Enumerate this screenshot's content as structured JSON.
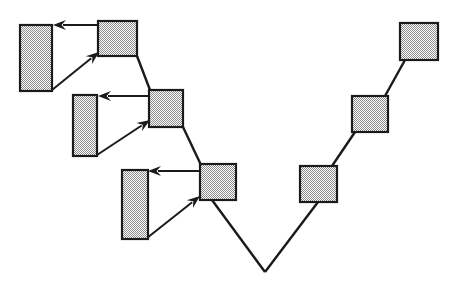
{
  "canvas": {
    "width": 462,
    "height": 296,
    "background": "#ffffff",
    "line_color": "#1a1a1a",
    "node_fill": "#a8a8a8",
    "node_stroke": "#1a1a1a"
  },
  "diagram": {
    "title": "",
    "type": "tree-diagram",
    "nodes": [
      {
        "id": "sq1",
        "label": "",
        "x": 98,
        "y": 21,
        "w": 39,
        "h": 35,
        "shape": "square"
      },
      {
        "id": "sq2",
        "label": "",
        "x": 149,
        "y": 90,
        "w": 34,
        "h": 37,
        "shape": "square"
      },
      {
        "id": "sq3",
        "label": "",
        "x": 200,
        "y": 164,
        "w": 36,
        "h": 36,
        "shape": "square"
      },
      {
        "id": "sq4",
        "label": "",
        "x": 300,
        "y": 166,
        "w": 37,
        "h": 36,
        "shape": "square"
      },
      {
        "id": "sq5",
        "label": "",
        "x": 352,
        "y": 96,
        "w": 36,
        "h": 36,
        "shape": "square"
      },
      {
        "id": "sq6",
        "label": "",
        "x": 400,
        "y": 23,
        "w": 38,
        "h": 37,
        "shape": "square"
      }
    ],
    "tall_rects": [
      {
        "id": "rect1",
        "label": "",
        "x": 20,
        "y": 25,
        "w": 32,
        "h": 66,
        "shape": "rectangle"
      },
      {
        "id": "rect2",
        "label": "",
        "x": 73,
        "y": 95,
        "w": 24,
        "h": 61,
        "shape": "rectangle"
      },
      {
        "id": "rect3",
        "label": "",
        "x": 122,
        "y": 170,
        "w": 26,
        "h": 69,
        "shape": "rectangle"
      }
    ],
    "edges": [
      {
        "id": "e1",
        "from": "sq1",
        "to": "sq2",
        "x1": 137,
        "y1": 56,
        "x2": 150,
        "y2": 90
      },
      {
        "id": "e2",
        "from": "sq2",
        "to": "sq3",
        "x1": 183,
        "y1": 127,
        "x2": 201,
        "y2": 165
      },
      {
        "id": "e3",
        "from": "sq3",
        "to": "apex",
        "x1": 212,
        "y1": 200,
        "x2": 265,
        "y2": 272
      },
      {
        "id": "e4",
        "from": "apex",
        "to": "sq4",
        "x1": 265,
        "y1": 272,
        "x2": 318,
        "y2": 202
      },
      {
        "id": "e5",
        "from": "sq4",
        "to": "sq5",
        "x1": 332,
        "y1": 166,
        "x2": 355,
        "y2": 132
      },
      {
        "id": "e6",
        "from": "sq5",
        "to": "sq6",
        "x1": 385,
        "y1": 96,
        "x2": 405,
        "y2": 60
      }
    ],
    "apex": {
      "id": "apex",
      "x": 265,
      "y": 272
    },
    "arrows": [
      {
        "id": "a1",
        "kind": "horizontal",
        "from": "sq1",
        "to": "rect1",
        "x1": 98,
        "y1": 25,
        "x2": 53,
        "y2": 25
      },
      {
        "id": "a2",
        "kind": "diagonal",
        "from": "rect1",
        "to": "sq1",
        "x1": 52,
        "y1": 90,
        "x2": 99,
        "y2": 52
      },
      {
        "id": "a3",
        "kind": "horizontal",
        "from": "sq2",
        "to": "rect2",
        "x1": 149,
        "y1": 96,
        "x2": 98,
        "y2": 96
      },
      {
        "id": "a4",
        "kind": "diagonal",
        "from": "rect2",
        "to": "sq2",
        "x1": 97,
        "y1": 155,
        "x2": 150,
        "y2": 120
      },
      {
        "id": "a5",
        "kind": "horizontal",
        "from": "sq3",
        "to": "rect3",
        "x1": 200,
        "y1": 171,
        "x2": 148,
        "y2": 171
      },
      {
        "id": "a6",
        "kind": "diagonal",
        "from": "rect3",
        "to": "sq3",
        "x1": 147,
        "y1": 238,
        "x2": 200,
        "y2": 196
      }
    ]
  }
}
